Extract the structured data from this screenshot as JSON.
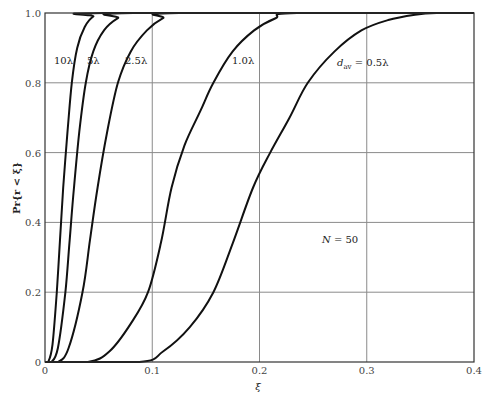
{
  "chart_data": {
    "type": "line",
    "title": "",
    "xlabel": "ξ",
    "ylabel": "Pr{r < ξ}",
    "xlim": [
      0,
      0.4
    ],
    "ylim": [
      0,
      1.0
    ],
    "grid": true,
    "x_ticks": [
      "0",
      "0.1",
      "0.2",
      "0.3",
      "0.4"
    ],
    "y_ticks": [
      "0",
      "0.2",
      "0.4",
      "0.6",
      "0.8",
      "1.0"
    ],
    "annotation": "N = 50",
    "series": [
      {
        "name": "10λ",
        "label": "10λ",
        "x": [
          0,
          0.003,
          0.007,
          0.011,
          0.014,
          0.017,
          0.021,
          0.025,
          0.03,
          0.037,
          0.045,
          0.055,
          0.4
        ],
        "y": [
          0,
          0,
          0.05,
          0.2,
          0.35,
          0.5,
          0.66,
          0.8,
          0.9,
          0.96,
          0.99,
          1.0,
          1.0
        ]
      },
      {
        "name": "5λ",
        "label": "5λ",
        "x": [
          0,
          0.006,
          0.012,
          0.019,
          0.023,
          0.027,
          0.032,
          0.038,
          0.045,
          0.055,
          0.068,
          0.082,
          0.4
        ],
        "y": [
          0,
          0,
          0.04,
          0.2,
          0.35,
          0.5,
          0.66,
          0.8,
          0.89,
          0.95,
          0.985,
          1.0,
          1.0
        ]
      },
      {
        "name": "2.5λ",
        "label": "2.5λ",
        "x": [
          0,
          0.012,
          0.022,
          0.035,
          0.042,
          0.049,
          0.058,
          0.068,
          0.08,
          0.095,
          0.11,
          0.125,
          0.4
        ],
        "y": [
          0,
          0,
          0.04,
          0.2,
          0.35,
          0.5,
          0.66,
          0.8,
          0.89,
          0.95,
          0.985,
          1.0,
          1.0
        ]
      },
      {
        "name": "1.0λ",
        "label": "1.0λ",
        "x": [
          0,
          0.04,
          0.06,
          0.08,
          0.096,
          0.108,
          0.118,
          0.13,
          0.145,
          0.157,
          0.175,
          0.195,
          0.215,
          0.235,
          0.4
        ],
        "y": [
          0,
          0,
          0.03,
          0.11,
          0.2,
          0.34,
          0.5,
          0.62,
          0.72,
          0.8,
          0.89,
          0.95,
          0.985,
          1.0,
          1.0
        ]
      },
      {
        "name": "0.5λ",
        "label": "d_av = 0.5λ",
        "x": [
          0,
          0.088,
          0.11,
          0.135,
          0.157,
          0.175,
          0.194,
          0.21,
          0.228,
          0.245,
          0.27,
          0.295,
          0.32,
          0.345,
          0.365,
          0.4
        ],
        "y": [
          0,
          0,
          0.03,
          0.1,
          0.2,
          0.34,
          0.5,
          0.6,
          0.7,
          0.8,
          0.89,
          0.95,
          0.98,
          0.995,
          1.0,
          1.0
        ]
      }
    ]
  },
  "labels": {
    "curve_10": "10λ",
    "curve_5": "5λ",
    "curve_2_5": "2.5λ",
    "curve_1_0": "1.0λ",
    "curve_0_5_prefix": "d",
    "curve_0_5_sub": "av",
    "curve_0_5_suffix": " = 0.5λ",
    "annotation_n_italic": "N",
    "annotation_n_rest": " = 50",
    "xlabel": "ξ",
    "ylabel": "Pr{r < ξ}"
  }
}
